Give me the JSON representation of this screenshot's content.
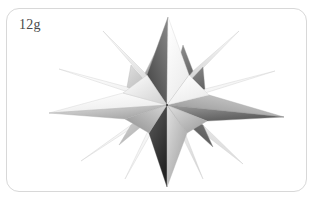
{
  "panel": {
    "label": "12g",
    "border_color": "#d8d8d8",
    "background_color": "#ffffff",
    "corner_radius_px": 13
  },
  "figure": {
    "subject_name": "stellated-polyhedron-star",
    "palette": {
      "highlight": "#ffffff",
      "light_gray": "#e8e8e8",
      "mid_gray": "#b4b4b4",
      "shadow_gray": "#808080",
      "dark_gray": "#4a4a4a",
      "deep_shadow": "#2a2a2a",
      "outline": "#9a9a9a"
    },
    "center": {
      "x": 160,
      "y": 96
    },
    "spike_count": 12,
    "spikes": [
      {
        "name": "spike-top",
        "tip_x": 161,
        "tip_y": 8,
        "base_half_width": 17,
        "face_left": "#6e6e6e",
        "face_right": "#f4f4f4"
      },
      {
        "name": "spike-upper-right-outer",
        "tip_x": 232,
        "tip_y": 22,
        "base_half_width": 15,
        "face_left": "#cfcfcf",
        "face_right": "#8e8e8e"
      },
      {
        "name": "spike-right-upper",
        "tip_x": 268,
        "tip_y": 62,
        "base_half_width": 14,
        "face_left": "#ededed",
        "face_right": "#9d9d9d"
      },
      {
        "name": "spike-right",
        "tip_x": 277,
        "tip_y": 108,
        "base_half_width": 15,
        "face_left": "#cacaca",
        "face_right": "#6a6a6a"
      },
      {
        "name": "spike-lower-right",
        "tip_x": 236,
        "tip_y": 155,
        "base_half_width": 16,
        "face_left": "#e2e2e2",
        "face_right": "#7d7d7d"
      },
      {
        "name": "spike-bottom-right-inner",
        "tip_x": 196,
        "tip_y": 170,
        "base_half_width": 13,
        "face_left": "#f0f0f0",
        "face_right": "#a8a8a8"
      },
      {
        "name": "spike-bottom",
        "tip_x": 160,
        "tip_y": 178,
        "base_half_width": 16,
        "face_left": "#3a3a3a",
        "face_right": "#d2d2d2"
      },
      {
        "name": "spike-bottom-left-inner",
        "tip_x": 118,
        "tip_y": 170,
        "base_half_width": 13,
        "face_left": "#fafafa",
        "face_right": "#bdbdbd"
      },
      {
        "name": "spike-lower-left",
        "tip_x": 74,
        "tip_y": 152,
        "base_half_width": 16,
        "face_left": "#f6f6f6",
        "face_right": "#b0b0b0"
      },
      {
        "name": "spike-left",
        "tip_x": 42,
        "tip_y": 104,
        "base_half_width": 15,
        "face_left": "#ececec",
        "face_right": "#8a8a8a"
      },
      {
        "name": "spike-left-upper",
        "tip_x": 52,
        "tip_y": 60,
        "base_half_width": 14,
        "face_left": "#f2f2f2",
        "face_right": "#9f9f9f"
      },
      {
        "name": "spike-upper-left-outer",
        "tip_x": 96,
        "tip_y": 22,
        "base_half_width": 15,
        "face_left": "#e6e6e6",
        "face_right": "#707070"
      }
    ]
  }
}
